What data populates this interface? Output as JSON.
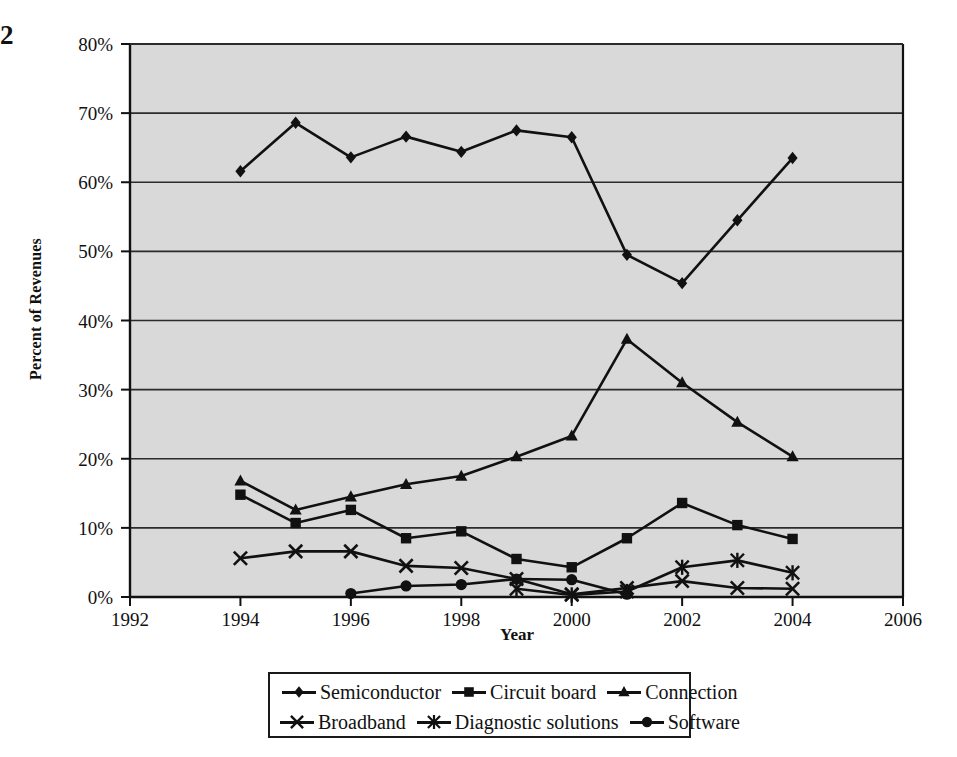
{
  "page_marker": "2",
  "chart_data": {
    "type": "line",
    "title": "",
    "xlabel": "Year",
    "ylabel": "Percent of Revenues",
    "xlim": [
      1992,
      2006
    ],
    "ylim": [
      0,
      80
    ],
    "x_ticks": [
      "1992",
      "1994",
      "1996",
      "1998",
      "2000",
      "2002",
      "2004",
      "2006"
    ],
    "x_tick_values": [
      1992,
      1994,
      1996,
      1998,
      2000,
      2002,
      2004,
      2006
    ],
    "y_ticks": [
      "0%",
      "10%",
      "20%",
      "30%",
      "40%",
      "50%",
      "60%",
      "70%",
      "80%"
    ],
    "y_tick_values": [
      0,
      10,
      20,
      30,
      40,
      50,
      60,
      70,
      80
    ],
    "grid": "horizontal",
    "legend_position": "bottom",
    "plot_background": "#d9d9d9",
    "line_color": "#111111",
    "series": [
      {
        "name": "Semiconductor",
        "marker": "diamond",
        "x": [
          1994,
          1995,
          1996,
          1997,
          1998,
          1999,
          2000,
          2001,
          2002,
          2003,
          2004
        ],
        "values": [
          61.6,
          68.6,
          63.6,
          66.6,
          64.4,
          67.5,
          66.5,
          49.5,
          45.4,
          54.5,
          63.5
        ]
      },
      {
        "name": "Circuit board",
        "marker": "square",
        "x": [
          1994,
          1995,
          1996,
          1997,
          1998,
          1999,
          2000,
          2001,
          2002,
          2003,
          2004
        ],
        "values": [
          14.8,
          10.7,
          12.6,
          8.5,
          9.5,
          5.5,
          4.3,
          8.5,
          13.6,
          10.4,
          8.4
        ]
      },
      {
        "name": "Connection",
        "marker": "triangle",
        "x": [
          1994,
          1995,
          1996,
          1997,
          1998,
          1999,
          2000,
          2001,
          2002,
          2003,
          2004
        ],
        "values": [
          16.8,
          12.6,
          14.5,
          16.3,
          17.5,
          20.3,
          23.3,
          37.3,
          31.0,
          25.3,
          20.3
        ]
      },
      {
        "name": "Broadband",
        "marker": "cross",
        "x": [
          1994,
          1995,
          1996,
          1997,
          1998,
          1999,
          2000,
          2001,
          2002,
          2003,
          2004
        ],
        "values": [
          5.6,
          6.6,
          6.6,
          4.5,
          4.2,
          2.6,
          0.4,
          1.3,
          2.3,
          1.3,
          1.2
        ]
      },
      {
        "name": "Diagnostic solutions",
        "marker": "asterisk",
        "x": [
          1999,
          2000,
          2001,
          2002,
          2003,
          2004
        ],
        "values": [
          1.2,
          0.3,
          0.8,
          4.3,
          5.3,
          3.5
        ]
      },
      {
        "name": "Software",
        "marker": "circle",
        "x": [
          1996,
          1997,
          1998,
          1999,
          2000,
          2001
        ],
        "values": [
          0.5,
          1.6,
          1.8,
          2.6,
          2.5,
          0.4
        ]
      }
    ]
  }
}
